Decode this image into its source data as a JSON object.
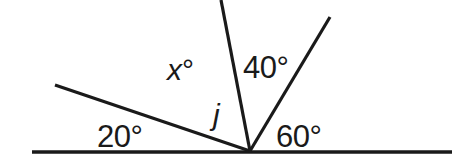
{
  "figure": {
    "type": "angle-diagram",
    "width": 471,
    "height": 161,
    "background_color": "#ffffff",
    "stroke_color": "#1a1a1a"
  },
  "vertex": {
    "x": 250,
    "y": 151
  },
  "baseline": {
    "name": "horizontal-straight-line",
    "x1": 32,
    "y1": 152,
    "x2": 452,
    "y2": 152,
    "thickness": 3.4
  },
  "rays": [
    {
      "id": "ray-20",
      "name": "ray-upper-left",
      "x1": 250,
      "y1": 151,
      "x2": 55,
      "y2": 85,
      "thickness": 3.2,
      "angle_from_positive_x_axis": 161
    },
    {
      "id": "ray-j",
      "name": "ray-j-near-vertical",
      "x1": 250,
      "y1": 151,
      "x2": 221,
      "y2": 0,
      "thickness": 3.2,
      "angle_from_positive_x_axis": 101
    },
    {
      "id": "ray-60",
      "name": "ray-upper-right",
      "x1": 250,
      "y1": 151,
      "x2": 330,
      "y2": 17,
      "thickness": 3.2,
      "angle_from_positive_x_axis": 59
    }
  ],
  "labels": {
    "x_angle": "x°",
    "x_variable": "x",
    "degree_symbol": "°",
    "angle_40": "40°",
    "ray_j": "j",
    "angle_20": "20°",
    "angle_60": "60°"
  },
  "chart_data": {
    "type": "diagram",
    "vertex_label": "",
    "angles": [
      {
        "label": "20°",
        "value": 20,
        "unit": "degrees",
        "between": [
          "baseline-left",
          "ray-upper-left"
        ]
      },
      {
        "label": "x°",
        "value": null,
        "unit": "degrees",
        "unknown": true,
        "variable": "x",
        "between": [
          "ray-upper-left",
          "ray-j-near-vertical"
        ]
      },
      {
        "label": "40°",
        "value": 40,
        "unit": "degrees",
        "between": [
          "ray-j-near-vertical",
          "ray-upper-right"
        ]
      },
      {
        "label": "60°",
        "value": 60,
        "unit": "degrees",
        "between": [
          "ray-upper-right",
          "baseline-right"
        ]
      }
    ],
    "line_labels": [
      {
        "label": "j",
        "refers_to": "ray-j-near-vertical"
      }
    ]
  }
}
